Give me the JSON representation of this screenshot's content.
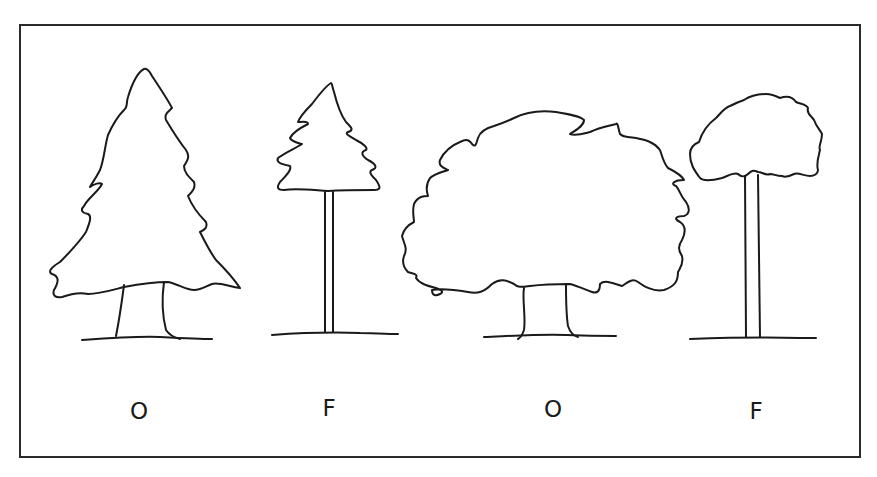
{
  "figure": {
    "stroke_color": "#1a1a1a",
    "background": "#ffffff",
    "trees": [
      {
        "shape": "conifer-broad-crown-short-trunk",
        "label": "O"
      },
      {
        "shape": "conifer-small-crown-tall-trunk",
        "label": "F"
      },
      {
        "shape": "deciduous-broad-crown-short-trunk",
        "label": "O"
      },
      {
        "shape": "deciduous-small-crown-tall-trunk",
        "label": "F"
      }
    ]
  }
}
